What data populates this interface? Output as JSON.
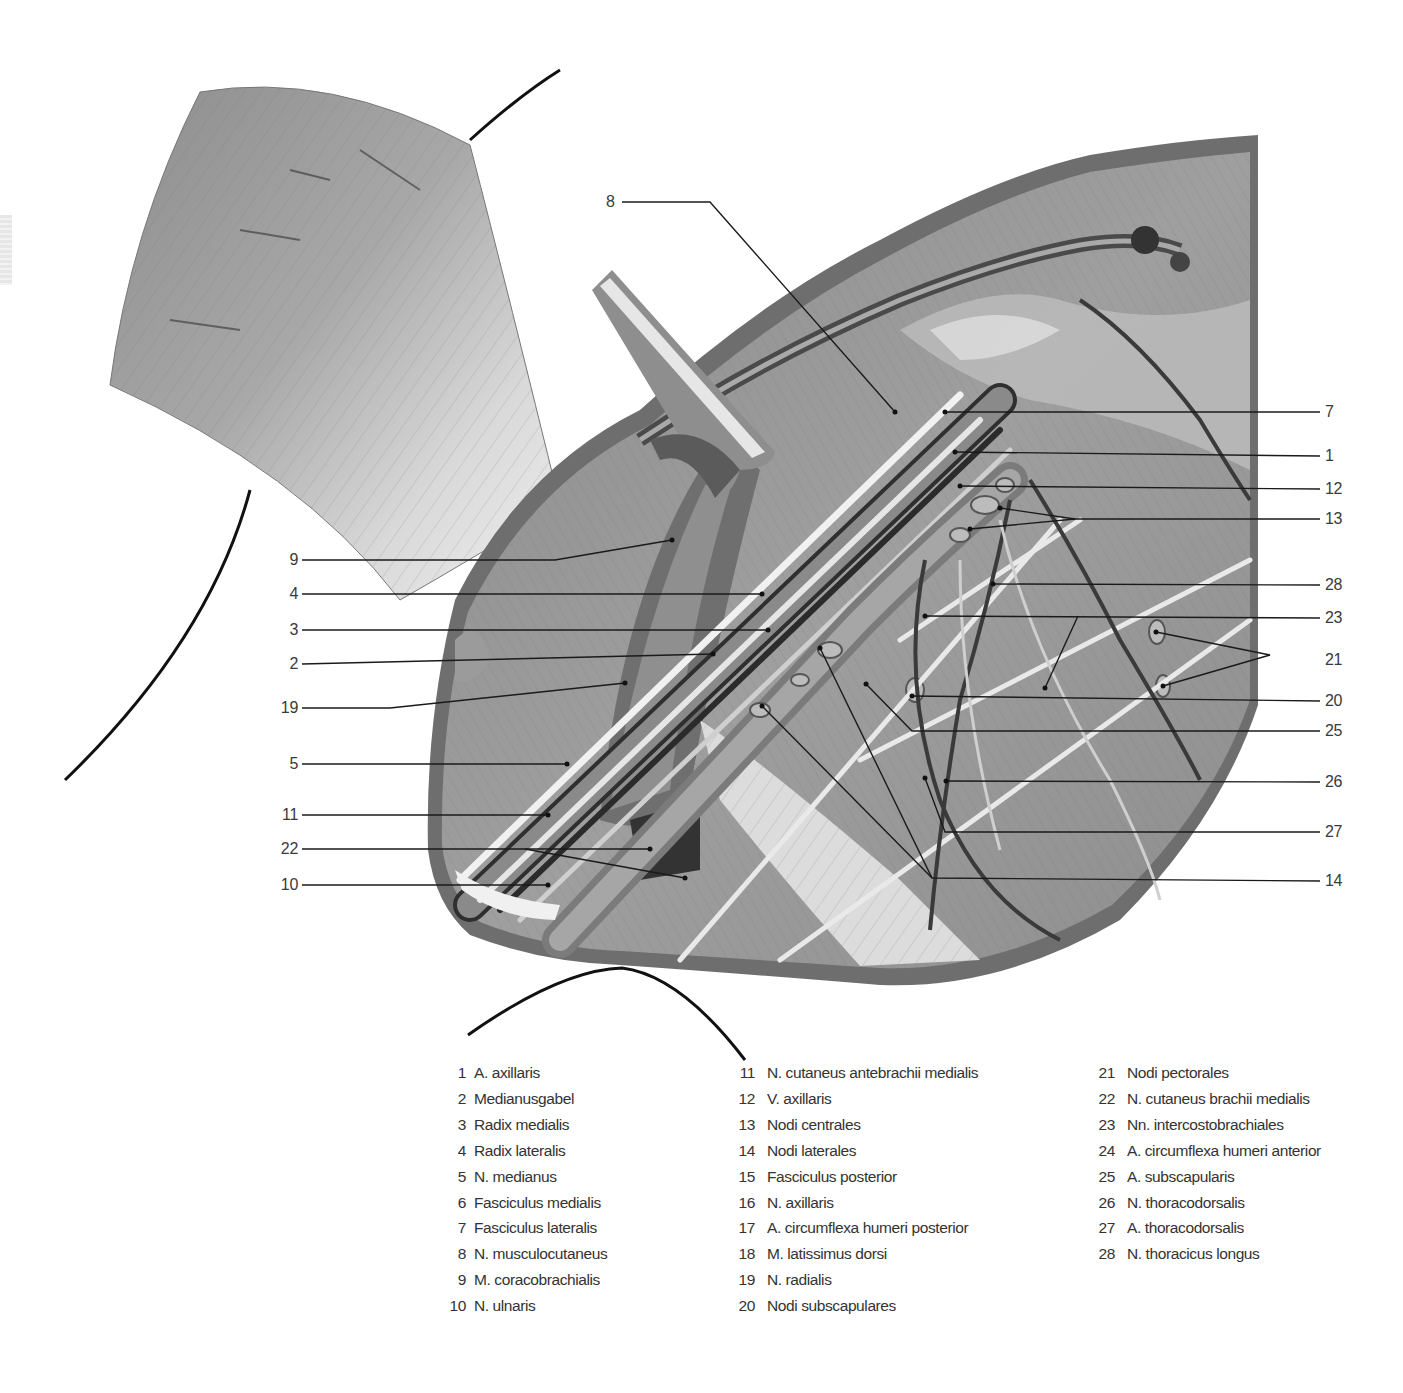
{
  "page": {
    "header_fragment": "",
    "tab_marker": "page-tab"
  },
  "figure": {
    "type": "anatomical-illustration",
    "palette": {
      "background": "#ffffff",
      "skin_border": "#6e6e6e",
      "muscle_light": "#c9c9c9",
      "muscle_mid": "#9a9a9a",
      "muscle_dark": "#4a4a4a",
      "nerve": "#e8e8e8",
      "vessel": "#3c3c3c",
      "leader_line": "#1a1a1a",
      "outline": "#111111"
    }
  },
  "callouts_left": [
    {
      "num": "9",
      "x": 283,
      "y": 560,
      "line": [
        [
          302,
          560
        ],
        [
          555,
          560
        ],
        [
          672,
          540
        ]
      ]
    },
    {
      "num": "4",
      "x": 283,
      "y": 594,
      "line": [
        [
          302,
          594
        ],
        [
          762,
          594
        ]
      ]
    },
    {
      "num": "3",
      "x": 283,
      "y": 630,
      "line": [
        [
          302,
          630
        ],
        [
          768,
          630
        ]
      ]
    },
    {
      "num": "2",
      "x": 283,
      "y": 664,
      "line": [
        [
          302,
          664
        ],
        [
          713,
          654
        ]
      ]
    },
    {
      "num": "19",
      "x": 283,
      "y": 708,
      "line": [
        [
          302,
          708
        ],
        [
          390,
          708
        ],
        [
          625,
          683
        ]
      ]
    },
    {
      "num": "5",
      "x": 283,
      "y": 764,
      "line": [
        [
          302,
          764
        ],
        [
          567,
          764
        ]
      ]
    },
    {
      "num": "11",
      "x": 283,
      "y": 815,
      "line": [
        [
          302,
          815
        ],
        [
          548,
          815
        ]
      ]
    },
    {
      "num": "22",
      "x": 283,
      "y": 849,
      "line": [
        [
          302,
          849
        ],
        [
          525,
          849
        ],
        [
          685,
          878
        ]
      ]
    },
    {
      "num": "22b",
      "x": 0,
      "y": 0,
      "line": [
        [
          525,
          849
        ],
        [
          650,
          849
        ]
      ]
    },
    {
      "num": "10",
      "x": 283,
      "y": 885,
      "line": [
        [
          302,
          885
        ],
        [
          548,
          885
        ]
      ]
    }
  ],
  "callouts_right": [
    {
      "num": "7",
      "x": 1325,
      "y": 412,
      "line": [
        [
          1320,
          412
        ],
        [
          945,
          412
        ]
      ]
    },
    {
      "num": "1",
      "x": 1325,
      "y": 456,
      "line": [
        [
          1320,
          456
        ],
        [
          955,
          452
        ]
      ]
    },
    {
      "num": "12",
      "x": 1325,
      "y": 489,
      "line": [
        [
          1320,
          489
        ],
        [
          960,
          486
        ]
      ]
    },
    {
      "num": "13",
      "x": 1325,
      "y": 519,
      "line": [
        [
          1320,
          519
        ],
        [
          1075,
          519
        ],
        [
          1000,
          508
        ]
      ]
    },
    {
      "num": "13b",
      "x": 0,
      "y": 0,
      "line": [
        [
          1075,
          519
        ],
        [
          970,
          529
        ]
      ]
    },
    {
      "num": "28",
      "x": 1325,
      "y": 585,
      "line": [
        [
          1320,
          585
        ],
        [
          993,
          584
        ]
      ]
    },
    {
      "num": "23",
      "x": 1325,
      "y": 618,
      "line": [
        [
          1320,
          618
        ],
        [
          925,
          616
        ]
      ]
    },
    {
      "num": "23b",
      "x": 0,
      "y": 0,
      "line": [
        [
          1078,
          616
        ],
        [
          1045,
          688
        ]
      ]
    },
    {
      "num": "21",
      "x": 1325,
      "y": 660,
      "line": [
        [
          1270,
          655
        ],
        [
          1156,
          632
        ]
      ]
    },
    {
      "num": "21b",
      "x": 0,
      "y": 0,
      "line": [
        [
          1270,
          655
        ],
        [
          1163,
          686
        ]
      ]
    },
    {
      "num": "20",
      "x": 1325,
      "y": 701,
      "line": [
        [
          1320,
          701
        ],
        [
          912,
          696
        ]
      ]
    },
    {
      "num": "25",
      "x": 1325,
      "y": 731,
      "line": [
        [
          1320,
          731
        ],
        [
          912,
          731
        ],
        [
          866,
          684
        ]
      ]
    },
    {
      "num": "26",
      "x": 1325,
      "y": 782,
      "line": [
        [
          1320,
          782
        ],
        [
          946,
          781
        ]
      ]
    },
    {
      "num": "27",
      "x": 1325,
      "y": 832,
      "line": [
        [
          1320,
          832
        ],
        [
          945,
          832
        ],
        [
          925,
          778
        ]
      ]
    },
    {
      "num": "14",
      "x": 1325,
      "y": 881,
      "line": [
        [
          1320,
          881
        ],
        [
          932,
          878
        ],
        [
          820,
          648
        ]
      ]
    },
    {
      "num": "14b",
      "x": 0,
      "y": 0,
      "line": [
        [
          932,
          878
        ],
        [
          762,
          706
        ]
      ]
    }
  ],
  "callout_top": {
    "num": "8",
    "x": 606,
    "y": 202,
    "line": [
      [
        622,
        202
      ],
      [
        710,
        202
      ],
      [
        895,
        412
      ]
    ]
  },
  "legend": {
    "columns": [
      [
        {
          "num": "1",
          "label": "A. axillaris"
        },
        {
          "num": "2",
          "label": "Medianusgabel"
        },
        {
          "num": "3",
          "label": "Radix medialis"
        },
        {
          "num": "4",
          "label": "Radix lateralis"
        },
        {
          "num": "5",
          "label": "N. medianus"
        },
        {
          "num": "6",
          "label": "Fasciculus medialis"
        },
        {
          "num": "7",
          "label": "Fasciculus lateralis"
        },
        {
          "num": "8",
          "label": "N. musculocutaneus"
        },
        {
          "num": "9",
          "label": "M. coracobrachialis"
        },
        {
          "num": "10",
          "label": "N. ulnaris"
        }
      ],
      [
        {
          "num": "11",
          "label": "N. cutaneus antebrachii medialis"
        },
        {
          "num": "12",
          "label": "V. axillaris"
        },
        {
          "num": "13",
          "label": "Nodi centrales"
        },
        {
          "num": "14",
          "label": "Nodi laterales"
        },
        {
          "num": "15",
          "label": "Fasciculus posterior"
        },
        {
          "num": "16",
          "label": "N. axillaris"
        },
        {
          "num": "17",
          "label": "A. circumflexa humeri posterior"
        },
        {
          "num": "18",
          "label": "M. latissimus dorsi"
        },
        {
          "num": "19",
          "label": "N. radialis"
        },
        {
          "num": "20",
          "label": "Nodi subscapulares"
        }
      ],
      [
        {
          "num": "21",
          "label": "Nodi pectorales"
        },
        {
          "num": "22",
          "label": "N. cutaneus brachii medialis"
        },
        {
          "num": "23",
          "label": "Nn. intercostobrachiales"
        },
        {
          "num": "24",
          "label": "A. circumflexa humeri anterior"
        },
        {
          "num": "25",
          "label": "A. subscapularis"
        },
        {
          "num": "26",
          "label": "N. thoracodorsalis"
        },
        {
          "num": "27",
          "label": "A. thoracodorsalis"
        },
        {
          "num": "28",
          "label": "N. thoracicus longus"
        }
      ]
    ]
  }
}
